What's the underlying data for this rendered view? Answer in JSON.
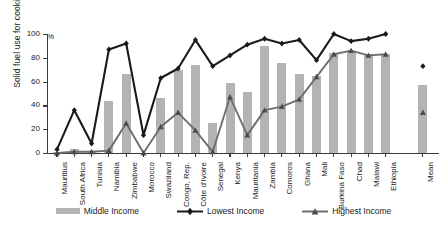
{
  "chart_data": {
    "type": "bar",
    "title": "",
    "xlabel": "",
    "ylabel": "Solid fuel use for cooking",
    "unit_label": "%",
    "ylim": [
      0,
      100
    ],
    "yticks": [
      0,
      20,
      40,
      60,
      80,
      100
    ],
    "grid": false,
    "legend_position": "bottom",
    "categories": [
      "Mauritius",
      "South Africa",
      "Tunisia",
      "Namibia",
      "Zimbabwe",
      "Morocco",
      "Swaziland",
      "Congo, Rep.",
      "Côte d'Ivoire",
      "Senegal",
      "Kenya",
      "Mauritania",
      "Zambia",
      "Comoros",
      "Ghana",
      "Mali",
      "Burkina Faso",
      "Chad",
      "Malawi",
      "Ethiopia",
      "Mean"
    ],
    "series": [
      {
        "name": "Middle Income",
        "type": "bar",
        "color": "#b3b3b3",
        "values": [
          1,
          3,
          1,
          44,
          66,
          0,
          46,
          70,
          74,
          25,
          59,
          51,
          90,
          76,
          66,
          65,
          84,
          86,
          83,
          83,
          57
        ]
      },
      {
        "name": "Lowest Income",
        "type": "line",
        "color": "#1a1a1a",
        "marker": "diamond",
        "values": [
          3,
          36,
          8,
          87,
          92,
          15,
          63,
          71,
          95,
          73,
          82,
          91,
          96,
          92,
          95,
          78,
          100,
          94,
          96,
          100,
          73
        ]
      },
      {
        "name": "Highest Income",
        "type": "line",
        "color": "#6e6e6e",
        "marker": "triangle",
        "values": [
          0,
          1,
          1,
          2,
          25,
          0,
          22,
          34,
          19,
          1,
          47,
          15,
          36,
          39,
          45,
          64,
          83,
          86,
          82,
          83,
          34
        ]
      }
    ]
  },
  "legend": {
    "items": [
      {
        "label": "Middle Income",
        "kind": "bar"
      },
      {
        "label": "Lowest Income",
        "kind": "line-diamond"
      },
      {
        "label": "Highest Income",
        "kind": "line-triangle"
      }
    ]
  }
}
